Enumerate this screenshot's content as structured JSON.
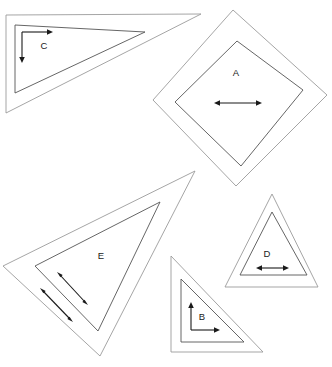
{
  "canvas": {
    "width": 332,
    "height": 367,
    "background": "#ffffff",
    "outline_color": "#9b9b9b",
    "inner_outline_color": "#555555",
    "arrow_color": "#1a1a1a",
    "label_color": "#1a1a1a"
  },
  "shapes": {
    "a": {
      "label": "A",
      "type": "diamond",
      "outer_points": "233,10 327,95 236,186 153,100",
      "inner_points": "237,41 303,90 241,166 175,102",
      "label_x": 236,
      "label_y": 73
    },
    "b": {
      "label": "B",
      "type": "right-triangle",
      "outer_points": "171,256 263,352 171,352",
      "inner_points": "181,279 244,342 181,342",
      "label_x": 202,
      "label_y": 317
    },
    "c": {
      "label": "C",
      "type": "right-triangle",
      "outer_points": "6,15 201,14 6,113",
      "inner_points": "15,25 145,32 15,93",
      "label_x": 44,
      "label_y": 46
    },
    "d": {
      "label": "D",
      "type": "equilateral-triangle",
      "outer_points": "272,194 318,287 225,287",
      "inner_points": "272,212 307,275 240,275",
      "label_x": 267,
      "label_y": 254
    },
    "e": {
      "label": "E",
      "type": "triangle",
      "outer_points": "195,171 100,356 3,266",
      "inner_points": "160,202 98,331 35,266",
      "label_x": 101,
      "label_y": 256
    }
  },
  "arrows": {
    "a_horizontal": {
      "x1": 214,
      "y1": 103,
      "x2": 262,
      "y2": 103,
      "heads": "both"
    },
    "b_vertical": {
      "x1": 191,
      "y1": 330,
      "x2": 191,
      "y2": 302,
      "heads": "end"
    },
    "b_horizontal": {
      "x1": 191,
      "y1": 330,
      "x2": 220,
      "y2": 330,
      "heads": "end"
    },
    "c_horizontal": {
      "x1": 22,
      "y1": 32,
      "x2": 53,
      "y2": 32,
      "heads": "end"
    },
    "c_vertical": {
      "x1": 22,
      "y1": 32,
      "x2": 22,
      "y2": 63,
      "heads": "end"
    },
    "d_horizontal": {
      "x1": 256,
      "y1": 268,
      "x2": 289,
      "y2": 268,
      "heads": "both"
    },
    "e_inner": {
      "x1": 88,
      "y1": 305,
      "x2": 57,
      "y2": 272,
      "heads": "both"
    },
    "e_outer": {
      "x1": 73,
      "y1": 322,
      "x2": 40,
      "y2": 288,
      "heads": "both"
    }
  }
}
